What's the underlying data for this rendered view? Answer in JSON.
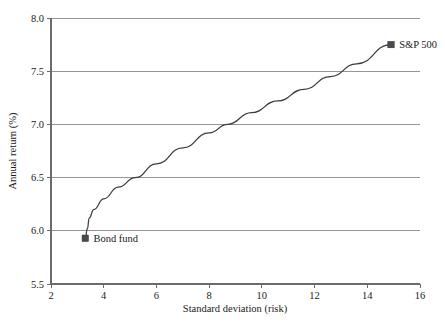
{
  "chart_data": {
    "type": "line",
    "title": "",
    "xlabel": "Standard deviation (risk)",
    "ylabel": "Annual return (%)",
    "xlim": [
      2,
      16
    ],
    "ylim": [
      5.5,
      8.0
    ],
    "xticks": [
      "2",
      "4",
      "6",
      "8",
      "10",
      "12",
      "14",
      "16"
    ],
    "xtick_values": [
      2,
      4,
      6,
      8,
      10,
      12,
      14,
      16
    ],
    "yticks": [
      "5.5",
      "6.0",
      "6.5",
      "7.0",
      "7.5",
      "8.0"
    ],
    "ytick_values": [
      5.5,
      6.0,
      6.5,
      7.0,
      7.5,
      8.0
    ],
    "grid": "horizontal",
    "legend": "none",
    "series": [
      {
        "name": "Efficient frontier",
        "x": [
          3.3,
          3.38,
          3.45,
          3.62,
          4.0,
          4.55,
          5.2,
          6.0,
          7.0,
          8.0,
          8.7,
          9.6,
          10.6,
          11.6,
          12.6,
          13.6,
          14.9
        ],
        "y": [
          5.93,
          6.02,
          6.12,
          6.2,
          6.3,
          6.41,
          6.5,
          6.63,
          6.78,
          6.92,
          7.0,
          7.11,
          7.22,
          7.33,
          7.45,
          7.57,
          7.75
        ]
      }
    ],
    "points": [
      {
        "label": "Bond fund",
        "x": 3.3,
        "y": 5.93,
        "marker": "square",
        "label_position": "right"
      },
      {
        "label": "S&P 500",
        "x": 14.9,
        "y": 7.75,
        "marker": "square",
        "label_position": "right"
      }
    ],
    "colors": {
      "line": "#3c3c3c",
      "marker": "#4a4a4a",
      "grid": "#8a8a8a",
      "axis": "#6b6b6b",
      "text": "#1a1a1a",
      "background": "#ffffff"
    }
  }
}
